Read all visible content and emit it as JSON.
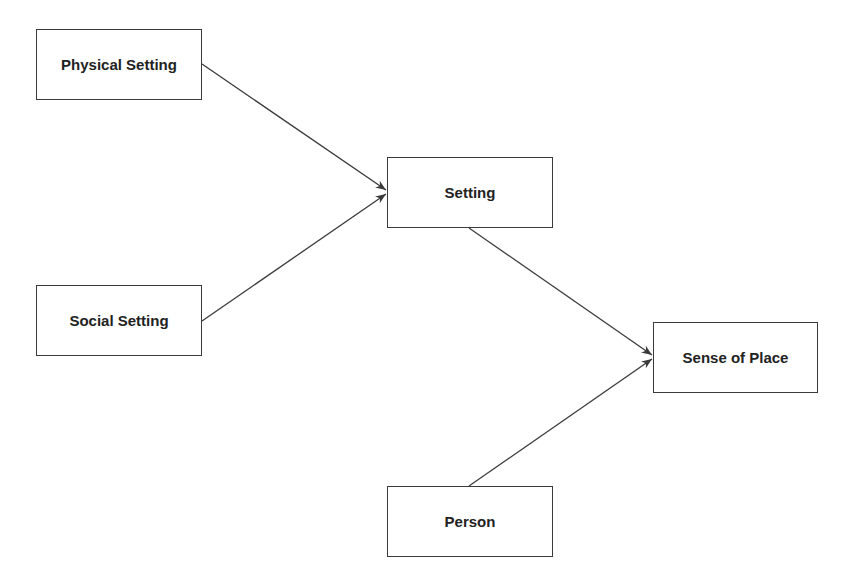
{
  "diagram": {
    "type": "flow",
    "nodes": [
      {
        "id": "physical",
        "label": "Physical Setting"
      },
      {
        "id": "setting",
        "label": "Setting"
      },
      {
        "id": "social",
        "label": "Social Setting"
      },
      {
        "id": "sense",
        "label": "Sense of Place"
      },
      {
        "id": "person",
        "label": "Person"
      }
    ],
    "edges": [
      {
        "from": "physical",
        "to": "setting"
      },
      {
        "from": "social",
        "to": "setting"
      },
      {
        "from": "setting",
        "to": "sense"
      },
      {
        "from": "person",
        "to": "sense"
      }
    ],
    "colors": {
      "line": "#3a3a3a",
      "text": "#222222",
      "background": "#ffffff"
    }
  }
}
